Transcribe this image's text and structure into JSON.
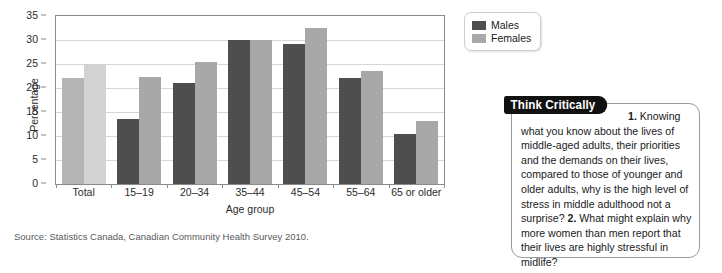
{
  "chart_data": {
    "type": "bar",
    "title": "",
    "xlabel": "Age group",
    "ylabel": "Percentage",
    "categories": [
      "Total",
      "15–19",
      "20–34",
      "35–44",
      "45–54",
      "55–64",
      "65 or older"
    ],
    "series": [
      {
        "name": "Males",
        "color": "#4e4e4e",
        "values": [
          22.0,
          13.5,
          21.1,
          30.0,
          29.2,
          22.0,
          10.5
        ]
      },
      {
        "name": "Females",
        "color": "#a8a8a8",
        "values": [
          25.0,
          22.2,
          25.4,
          30.0,
          32.5,
          23.5,
          13.2
        ]
      }
    ],
    "ylim": [
      0,
      35
    ],
    "yticks": [
      0,
      5,
      10,
      15,
      20,
      25,
      30,
      35
    ],
    "ytick_labels": [
      "0",
      "5",
      "10",
      "15",
      "20",
      "25",
      "30",
      "35"
    ],
    "grid": true,
    "legend_position": "top-right"
  },
  "legend": {
    "items": [
      {
        "label": "Males"
      },
      {
        "label": "Females"
      }
    ]
  },
  "source": {
    "text": "Source: Statistics Canada, Canadian Community Health Survey 2010."
  },
  "think_critically": {
    "banner": "Think Critically",
    "q1_num": "1.",
    "q1_text": "Knowing what you know about the lives of middle-aged adults, their priorities and the demands on their lives, compared to those of younger and older adults, why is the high level of stress in middle adulthood not a surprise?",
    "q2_num": "2.",
    "q2_text": "What might explain why more women than men report that their lives are highly stressful in midlife?"
  }
}
